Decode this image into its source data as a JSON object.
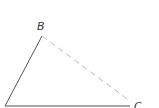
{
  "diagram": {
    "type": "triangle",
    "vertices": {
      "A": {
        "x": 5,
        "y": 106,
        "label": ""
      },
      "B": {
        "x": 42,
        "y": 36,
        "label": "B"
      },
      "C": {
        "x": 130,
        "y": 104,
        "label": "C"
      }
    },
    "edges": [
      {
        "from": "A",
        "to": "B",
        "style": "solid"
      },
      {
        "from": "A",
        "to": "C",
        "style": "solid"
      },
      {
        "from": "B",
        "to": "C",
        "style": "dashed"
      }
    ],
    "colors": {
      "solid_line": "#555555",
      "dashed_line": "#bbbbbb",
      "label": "#333333"
    }
  }
}
